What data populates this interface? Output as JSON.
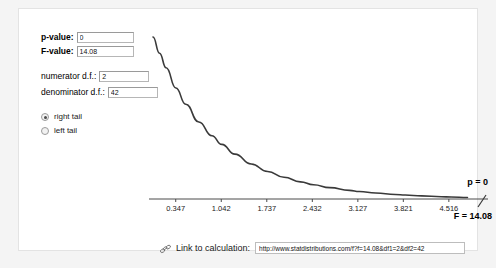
{
  "form": {
    "pvalue": {
      "label": "p-value:",
      "value": "0"
    },
    "fvalue": {
      "label": "F-value:",
      "value": "14.08"
    },
    "numerator_df": {
      "label": "numerator d.f.:",
      "value": "2"
    },
    "denominator_df": {
      "label": "denominator d.f.:",
      "value": "42"
    },
    "tail_options": [
      {
        "label": "right tail",
        "selected": true
      },
      {
        "label": "left tail",
        "selected": false
      }
    ]
  },
  "link_bar": {
    "icon": "link-icon",
    "label": "Link to calculation:",
    "url": "http://www.statdistributions.com/f?f=14.08&df1=2&df2=42"
  },
  "annotations": {
    "p_label": "p = 0",
    "f_label": "F = 14.08"
  },
  "chart_data": {
    "type": "line",
    "title": "",
    "xlabel": "",
    "ylabel": "",
    "grid": false,
    "legend": "none",
    "distribution": "F",
    "df1": 2,
    "df2": 42,
    "tail": "right",
    "tick_labels": [
      "0.347",
      "1.042",
      "1.737",
      "2.432",
      "3.127",
      "3.821",
      "4.516"
    ],
    "tick_values": [
      0.347,
      1.042,
      1.737,
      2.432,
      3.127,
      3.821,
      4.516
    ],
    "xlim": [
      0,
      4.9
    ],
    "ylim": [
      0,
      1.0
    ],
    "x": [
      0.0,
      0.1,
      0.2,
      0.35,
      0.5,
      0.7,
      0.9,
      1.05,
      1.25,
      1.5,
      1.75,
      2.0,
      2.25,
      2.45,
      2.7,
      3.0,
      3.15,
      3.4,
      3.7,
      3.85,
      4.1,
      4.4,
      4.55,
      4.8
    ],
    "y": [
      1.0,
      0.9,
      0.81,
      0.685,
      0.585,
      0.475,
      0.39,
      0.337,
      0.277,
      0.216,
      0.17,
      0.134,
      0.106,
      0.088,
      0.07,
      0.053,
      0.046,
      0.037,
      0.028,
      0.025,
      0.019,
      0.014,
      0.012,
      0.009
    ],
    "markers": [
      {
        "name": "p = 0",
        "x": 4.9,
        "note": "right tail area annotation"
      },
      {
        "name": "F = 14.08",
        "x": 4.72,
        "note": "observed F statistic tick beyond axis"
      }
    ]
  }
}
